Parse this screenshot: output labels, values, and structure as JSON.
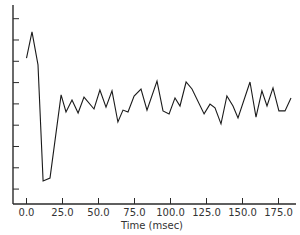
{
  "chart_data": {
    "type": "line",
    "title": "",
    "xlabel": "Time (msec)",
    "ylabel": "",
    "xlim": [
      -18,
      190
    ],
    "ylim": [
      0,
      9.3
    ],
    "x_ticks": [
      0,
      25,
      50,
      75,
      100,
      125,
      150,
      175
    ],
    "x_tick_labels": [
      "0.0",
      "25.0",
      "50.0",
      "75.0",
      "100.0",
      "125.0",
      "150.0",
      "175.0"
    ],
    "y_ticks": [
      0.7,
      1.7,
      2.7,
      3.7,
      4.7,
      5.7,
      6.7,
      7.7,
      8.7
    ],
    "y_tick_labels": [],
    "grid": false,
    "legend": null,
    "series": [
      {
        "name": "signal",
        "color": "#1a1a1a",
        "x": [
          0,
          3.8,
          8.0,
          11.5,
          16.3,
          24.0,
          27.4,
          31.6,
          35.8,
          39.9,
          46.9,
          51.0,
          55.2,
          59.4,
          63.5,
          67.0,
          70.5,
          74.7,
          79.5,
          83.7,
          90.6,
          94.8,
          99.0,
          103.1,
          106.6,
          110.8,
          114.9,
          123.3,
          127.4,
          130.9,
          135.1,
          139.2,
          143.4,
          146.9,
          155.2,
          159.4,
          163.5,
          167.0,
          171.2,
          175.3,
          179.5,
          183.7
        ],
        "y": [
          6.85,
          8.08,
          6.53,
          1.08,
          1.22,
          5.12,
          4.32,
          4.88,
          4.27,
          5.02,
          4.46,
          5.35,
          4.55,
          5.31,
          3.85,
          4.41,
          4.32,
          5.07,
          5.4,
          4.41,
          5.77,
          4.37,
          4.23,
          4.98,
          4.6,
          5.73,
          5.4,
          4.23,
          4.69,
          4.51,
          3.76,
          5.07,
          4.6,
          4.04,
          5.73,
          4.08,
          5.31,
          4.6,
          5.45,
          4.37,
          4.37,
          4.98
        ]
      }
    ]
  },
  "colors": {
    "axis": "#2a2a2a",
    "line": "#1a1a1a",
    "text": "#333333",
    "background": "#ffffff"
  }
}
